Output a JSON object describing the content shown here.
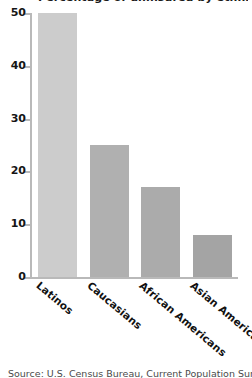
{
  "chart_data": {
    "type": "bar",
    "title": "Percentage of uninsured by ethnicity",
    "caption": "Source: U.S. Census Bureau, Current Population Survey",
    "categories": [
      "Latinos",
      "Caucasians",
      "African Americans",
      "Asian Americans"
    ],
    "values": [
      50,
      25,
      17,
      8
    ],
    "xlabel": "",
    "ylabel": "",
    "ylim": [
      0,
      50
    ],
    "yticks": [
      0,
      10,
      20,
      30,
      40,
      50
    ],
    "ytick_labels": [
      "0",
      "10",
      "20",
      "30",
      "40",
      "50"
    ],
    "grid": false,
    "legend": "none",
    "bar_colors": [
      "#cccccc",
      "#b0b0b0",
      "#ababab",
      "#a4a4a4"
    ],
    "axis_color": "#b9b9b9"
  }
}
